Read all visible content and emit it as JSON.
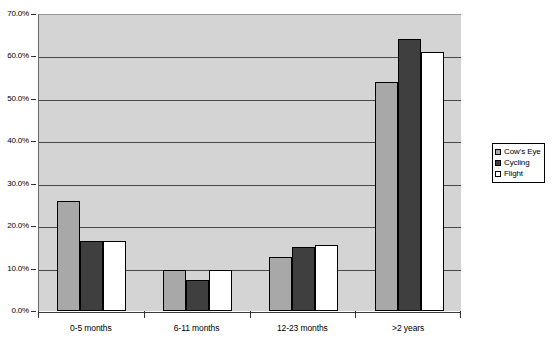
{
  "chart_data": {
    "type": "bar",
    "title": "",
    "subtitle": "",
    "xlabel": "",
    "ylabel": "",
    "categories": [
      "0-5 months",
      "6-11 months",
      "12-23 months",
      ">2 years"
    ],
    "series": [
      {
        "name": "Cow's Eye",
        "color": "#a8a8a8",
        "values": [
          26.0,
          9.7,
          12.7,
          54.0
        ]
      },
      {
        "name": "Cycling",
        "color": "#3f3f3f",
        "values": [
          16.5,
          7.3,
          15.0,
          64.0
        ]
      },
      {
        "name": "Flight",
        "color": "#ffffff",
        "values": [
          16.5,
          9.7,
          15.5,
          61.0
        ]
      }
    ],
    "ylim": [
      0,
      70
    ],
    "ytick_step": 10,
    "ytick_labels": [
      "0.0%",
      "10.0%",
      "20.0%",
      "30.0%",
      "40.0%",
      "50.0%",
      "60.0%",
      "70.0%"
    ],
    "ytick_values": [
      0,
      10,
      20,
      30,
      40,
      50,
      60,
      70
    ],
    "grid": true,
    "legend_position": "right",
    "plot_background": "#d4d4d4",
    "axis_color": "#333333",
    "gridline_color": "#4a4a4a"
  }
}
